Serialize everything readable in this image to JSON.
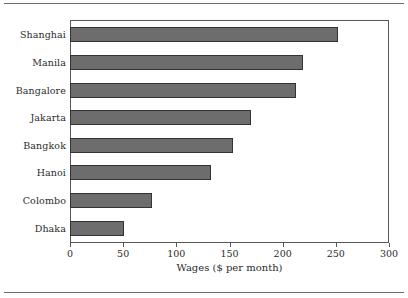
{
  "chart_data": {
    "type": "bar",
    "orientation": "horizontal",
    "title": "",
    "xlabel": "Wages ($ per month)",
    "ylabel": "",
    "categories": [
      "Shanghai",
      "Manila",
      "Bangalore",
      "Jakarta",
      "Bangkok",
      "Hanoi",
      "Colombo",
      "Dhaka"
    ],
    "values": [
      253,
      220,
      213,
      171,
      154,
      133,
      77,
      51
    ],
    "xlim": [
      0,
      300
    ],
    "xticks": [
      0,
      50,
      100,
      150,
      200,
      250,
      300
    ],
    "xtick_labels": [
      "0",
      "50",
      "100",
      "150",
      "200",
      "250",
      "300"
    ],
    "grid": false,
    "legend": null,
    "bar_color": "#6d6d6d",
    "bar_edge_color": "#333333",
    "frame_color": "#585858",
    "background": "#ffffff"
  }
}
